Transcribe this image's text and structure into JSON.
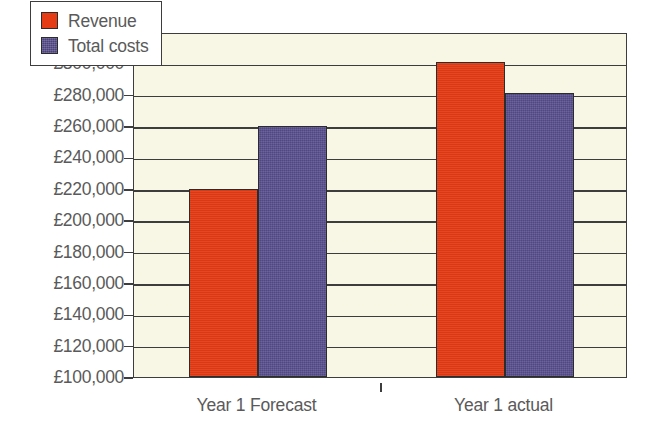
{
  "chart_data": {
    "type": "bar",
    "title": "",
    "subtitle": "",
    "xlabel": "",
    "ylabel": "",
    "categories": [
      "Year 1 Forecast",
      "Year 1 actual"
    ],
    "series": [
      {
        "name": "Revenue",
        "color": "#e53c15",
        "values": [
          220000,
          301000
        ]
      },
      {
        "name": "Total costs",
        "color": "#5a5090",
        "values": [
          260000,
          281000
        ]
      }
    ],
    "ylim": [
      100000,
      320000
    ],
    "ytick_step": 20000,
    "ytick_labels": [
      "£320,000",
      "£300,000",
      "£280,000",
      "£260,000",
      "£240,000",
      "£220,000",
      "£200,000",
      "£180,000",
      "£160,000",
      "£140,000",
      "£120,000",
      "£100,000"
    ],
    "ytick_values": [
      320000,
      300000,
      280000,
      260000,
      240000,
      220000,
      200000,
      180000,
      160000,
      140000,
      120000,
      100000
    ],
    "grid": true,
    "legend_position": "top-left-inside",
    "currency_symbol": "£",
    "plot_background": "#f8f7e6",
    "axis_color": "#3d3d3d",
    "page_background": "#ffffff"
  },
  "legend": {
    "entries": [
      {
        "label": "Revenue",
        "swatch": "revenue-swatch"
      },
      {
        "label": "Total costs",
        "swatch": "total-costs-swatch"
      }
    ]
  }
}
